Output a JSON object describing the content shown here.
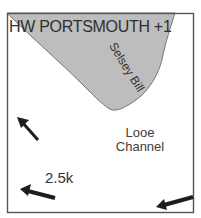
{
  "map": {
    "title": "HW PORTSMOUTH +1",
    "land_label": "Selsey Bill",
    "water_label_line1": "Looe",
    "water_label_line2": "Channel",
    "scale_label": "2.5k",
    "colors": {
      "land": "#bdbdbd",
      "land_outline": "#777777",
      "frame": "#555555",
      "arrow": "#1e1e1e",
      "background": "#ffffff"
    },
    "arrows": [
      {
        "name": "tidal-stream-arrow-northwest",
        "direction": "up-left"
      },
      {
        "name": "tidal-stream-arrow-west",
        "direction": "left",
        "label": "2.5k"
      },
      {
        "name": "tidal-stream-arrow-west-southeast",
        "direction": "left"
      }
    ]
  }
}
